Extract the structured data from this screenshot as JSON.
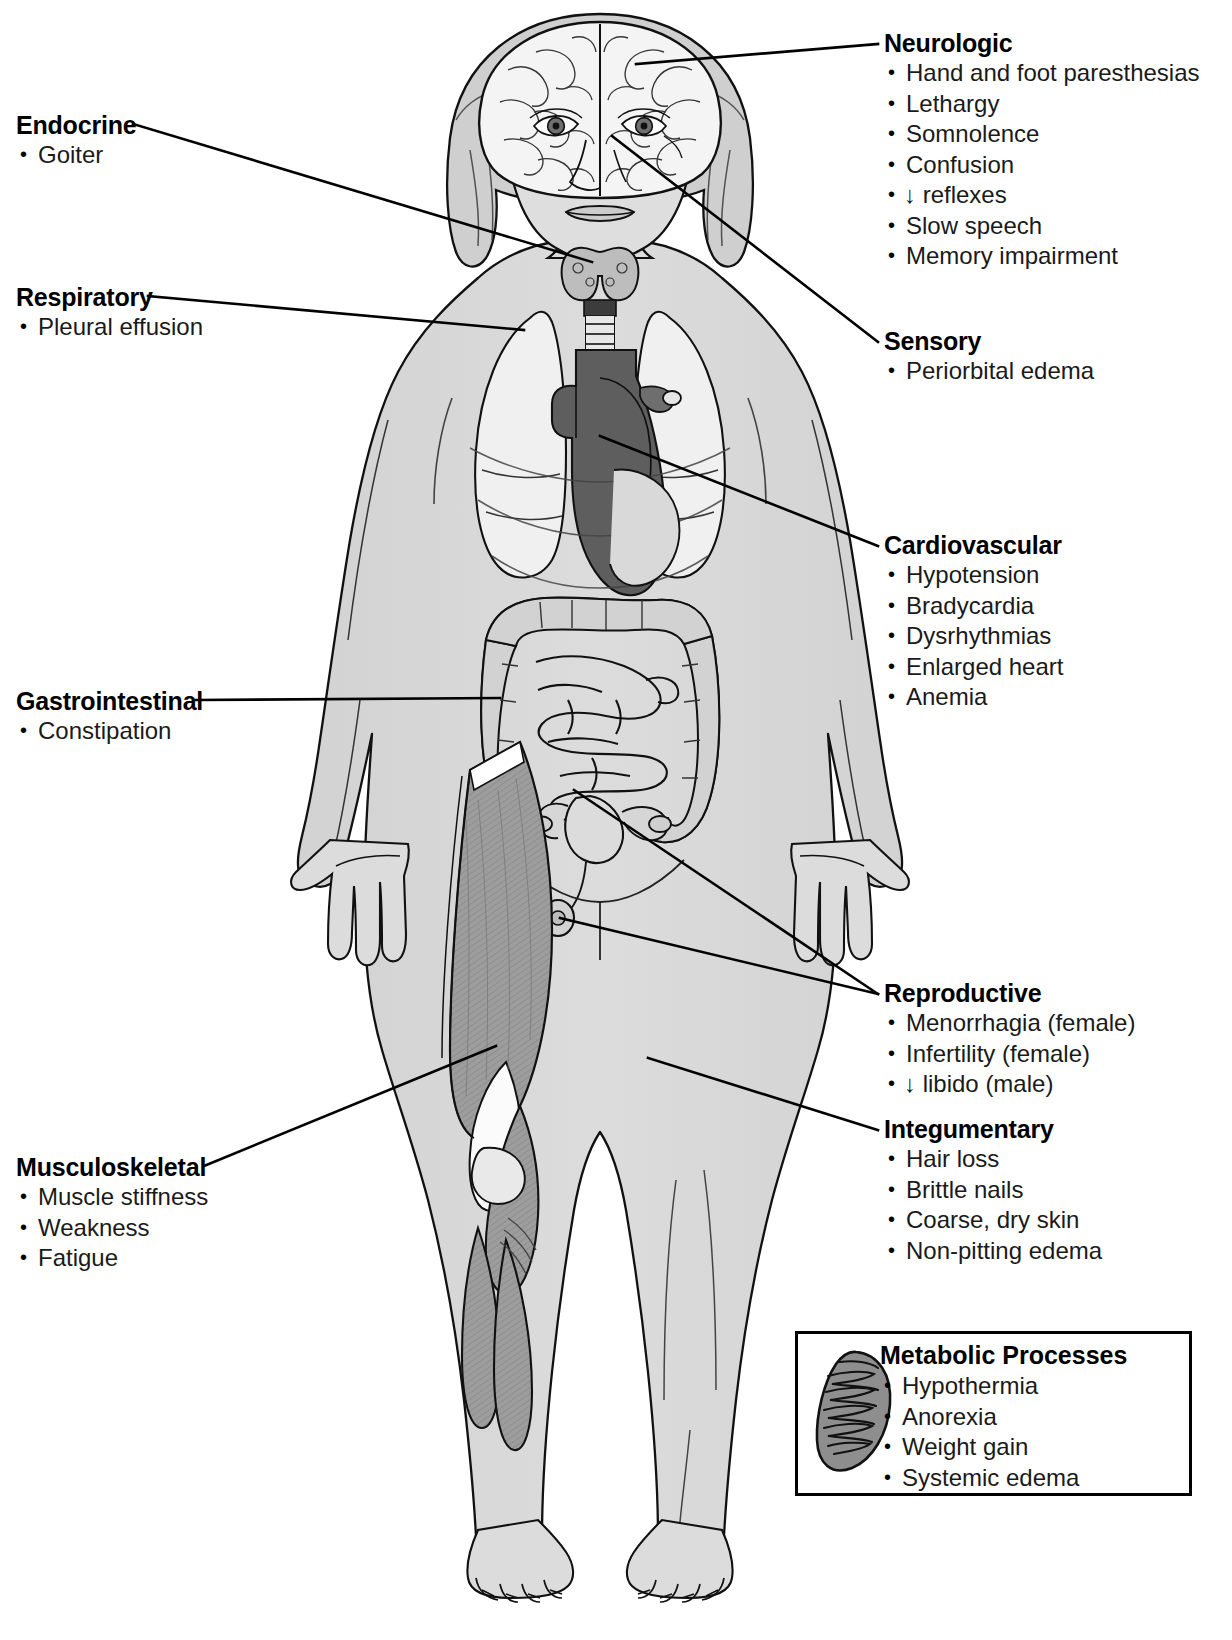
{
  "figure": {
    "regions": [
      "brain",
      "thyroid",
      "lungs",
      "heart",
      "aorta",
      "intestines",
      "uterus-ovaries",
      "thigh-muscles",
      "calf-muscles"
    ]
  },
  "colors": {
    "skin": "#d8d8d8",
    "organ_light": "#ececec",
    "organ_mid": "#b9b9b9",
    "organ_dark": "#6e6e6e",
    "muscle": "#9a9a9a",
    "outline": "#000000",
    "box_border": "#000000",
    "text": "#000000"
  },
  "callouts": [
    {
      "id": "endocrine",
      "title": "Endocrine",
      "items": [
        "Goiter"
      ]
    },
    {
      "id": "respiratory",
      "title": "Respiratory",
      "items": [
        "Pleural effusion"
      ]
    },
    {
      "id": "gastrointestinal",
      "title": "Gastrointestinal",
      "items": [
        "Constipation"
      ]
    },
    {
      "id": "musculoskeletal",
      "title": "Musculoskeletal",
      "items": [
        "Muscle stiffness",
        "Weakness",
        "Fatigue"
      ]
    },
    {
      "id": "neurologic",
      "title": "Neurologic",
      "items": [
        "Hand and foot paresthesias",
        "Lethargy",
        "Somnolence",
        "Confusion",
        "↓ reflexes",
        "Slow speech",
        "Memory impairment"
      ]
    },
    {
      "id": "sensory",
      "title": "Sensory",
      "items": [
        "Periorbital edema"
      ]
    },
    {
      "id": "cardiovascular",
      "title": "Cardiovascular",
      "items": [
        "Hypotension",
        "Bradycardia",
        "Dysrhythmias",
        "Enlarged heart",
        "Anemia"
      ]
    },
    {
      "id": "reproductive",
      "title": "Reproductive",
      "items": [
        "Menorrhagia (female)",
        "Infertility (female)",
        "↓ libido (male)"
      ]
    },
    {
      "id": "integumentary",
      "title": "Integumentary",
      "items": [
        "Hair loss",
        "Brittle nails",
        "Coarse, dry skin",
        "Non-pitting edema"
      ]
    }
  ],
  "metabolic": {
    "title": "Metabolic Processes",
    "icon": "mitochondrion-icon",
    "items": [
      "Hypothermia",
      "Anorexia",
      "Weight gain",
      "Systemic edema"
    ]
  }
}
